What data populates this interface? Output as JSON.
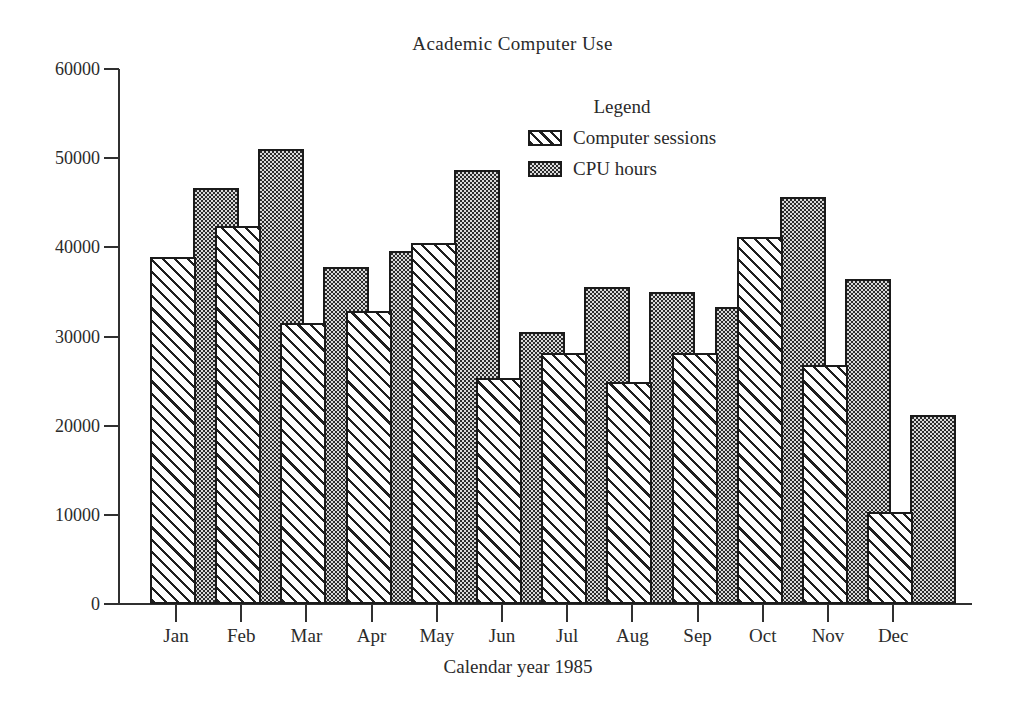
{
  "chart_data": {
    "type": "bar",
    "title": "Academic Computer Use",
    "xlabel": "Calendar year 1985",
    "ylabel": "",
    "ylim": [
      0,
      60000
    ],
    "ytick_values": [
      0,
      10000,
      20000,
      30000,
      40000,
      50000,
      60000
    ],
    "ytick_labels": [
      "0",
      "10000",
      "20000",
      "30000",
      "40000",
      "50000",
      "60000"
    ],
    "grid": false,
    "legend_title": "Legend",
    "legend_position": "inside-upper-right",
    "bar_mode": "overlap",
    "categories": [
      "Jan",
      "Feb",
      "Mar",
      "Apr",
      "May",
      "Jun",
      "Jul",
      "Aug",
      "Sep",
      "Oct",
      "Nov",
      "Dec"
    ],
    "series": [
      {
        "name": "Computer sessions",
        "pattern": "diagonal-hatch",
        "values": [
          38900,
          42400,
          31500,
          32900,
          40500,
          25300,
          28200,
          24900,
          28200,
          41200,
          26800,
          10300
        ]
      },
      {
        "name": "CPU hours",
        "pattern": "stipple-dots",
        "values": [
          46600,
          51000,
          37800,
          39600,
          48700,
          30500,
          35500,
          35000,
          33300,
          45700,
          36400,
          21200
        ]
      }
    ]
  },
  "colors": {
    "ink": "#1b1b1b",
    "text": "#2a2a2a",
    "cpu_fill": "#d9d9d9",
    "sessions_fill": "#ffffff",
    "background": "#ffffff"
  }
}
